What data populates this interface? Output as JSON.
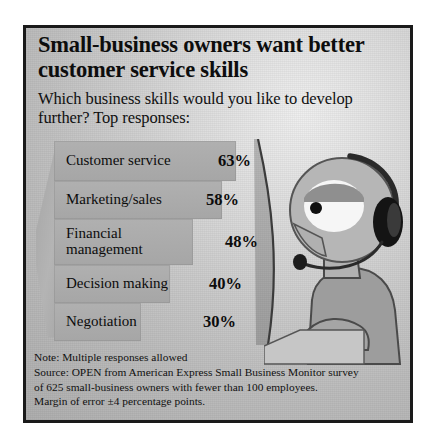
{
  "headline": "Small-business owners want better customer service skills",
  "subhead": "Which business skills would you like to develop further? Top responses:",
  "chart_data": {
    "type": "bar",
    "title": "Small-business owners want better customer service skills",
    "subtitle": "Which business skills would you like to develop further? Top responses:",
    "categories": [
      "Customer service",
      "Marketing/sales",
      "Financial management",
      "Decision making",
      "Negotiation"
    ],
    "values": [
      63,
      58,
      48,
      40,
      30
    ],
    "value_labels": [
      "63%",
      "58%",
      "48%",
      "40%",
      "30%"
    ],
    "xlabel": "",
    "ylabel": "",
    "xlim": [
      0,
      63
    ],
    "grid": false,
    "legend": "none",
    "orientation": "horizontal",
    "bar_color": "#a9a9a9"
  },
  "notes": {
    "line1": "Note: Multiple responses allowed",
    "line2": "Source: OPEN from American Express Small Business Monitor survey",
    "line3": "of 625 small-business owners with fewer than 100 employees.",
    "line4": "Margin of error ±4 percentage points."
  },
  "illustration": {
    "name": "customer-service-operator-with-headset",
    "skin_color": "#b5b5b5",
    "headset_color": "#1b1b1b",
    "body_color": "#9a9a9a"
  },
  "colors": {
    "frame_border": "#1a1a1a",
    "background": "#cfcfcf",
    "text": "#0d0d0d"
  }
}
